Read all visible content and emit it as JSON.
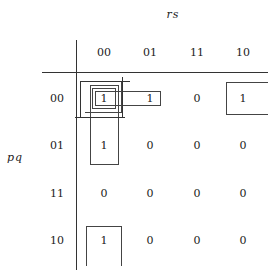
{
  "kmap": {
    "column_variable": "rs",
    "row_variable": "pq",
    "column_headers": [
      "00",
      "01",
      "11",
      "10"
    ],
    "row_headers": [
      "00",
      "01",
      "11",
      "10"
    ],
    "cells": [
      [
        "1",
        "1",
        "0",
        "1"
      ],
      [
        "1",
        "0",
        "0",
        "0"
      ],
      [
        "0",
        "0",
        "0",
        "0"
      ],
      [
        "1",
        "0",
        "0",
        "0"
      ]
    ],
    "groupings": [
      {
        "name": "pair (pq=00, rs=00-01)",
        "cells": [
          [
            0,
            0
          ],
          [
            0,
            1
          ]
        ]
      },
      {
        "name": "corners wrap (rs=00 and rs=10, pq=00)",
        "cells": [
          [
            0,
            0
          ],
          [
            0,
            3
          ]
        ]
      },
      {
        "name": "column pair (pq=00-01, rs=00)",
        "cells": [
          [
            0,
            0
          ],
          [
            1,
            0
          ]
        ]
      },
      {
        "name": "wrap column (pq=00 and pq=10, rs=00)",
        "cells": [
          [
            0,
            0
          ],
          [
            3,
            0
          ]
        ]
      }
    ]
  }
}
